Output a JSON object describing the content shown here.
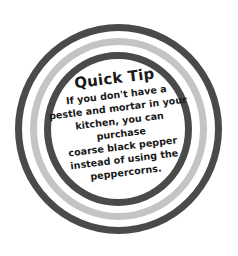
{
  "tip": {
    "title": "Quick Tip",
    "lines": [
      "If you don't have a",
      "pestle and mortar in your",
      "kitchen, you can purchase",
      "coarse black pepper",
      "instead of using the",
      "peppercorns."
    ]
  },
  "colors": {
    "ring_dark": "#4a4a4a",
    "ring_light": "#c4c4c4",
    "text": "#1a1a1a",
    "background": "#ffffff"
  }
}
